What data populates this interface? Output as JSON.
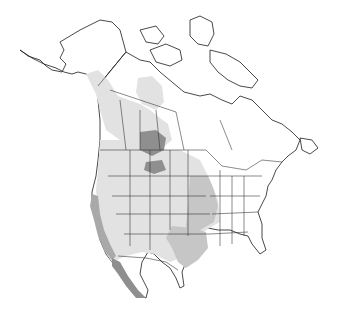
{
  "map": {
    "title": "",
    "region": "North America",
    "type": "species range map",
    "legend": [],
    "colors": {
      "background": "#ffffff",
      "land": "#ffffff",
      "outline": "#1a1a1a",
      "range_light": "#e2e2e2",
      "range_mid": "#c6c6c6",
      "range_dark": "#8f8f8f"
    },
    "range_areas": [
      {
        "name": "pacific-coast-dark-range",
        "shade": "dark"
      },
      {
        "name": "baja-california-dark-range",
        "shade": "dark"
      },
      {
        "name": "prairie-dark-range",
        "shade": "dark"
      },
      {
        "name": "western-interior-light-range",
        "shade": "light"
      },
      {
        "name": "great-plains-mid-range",
        "shade": "mid"
      },
      {
        "name": "texas-mid-range",
        "shade": "mid"
      },
      {
        "name": "northwest-canada-light-range",
        "shade": "light"
      }
    ]
  }
}
